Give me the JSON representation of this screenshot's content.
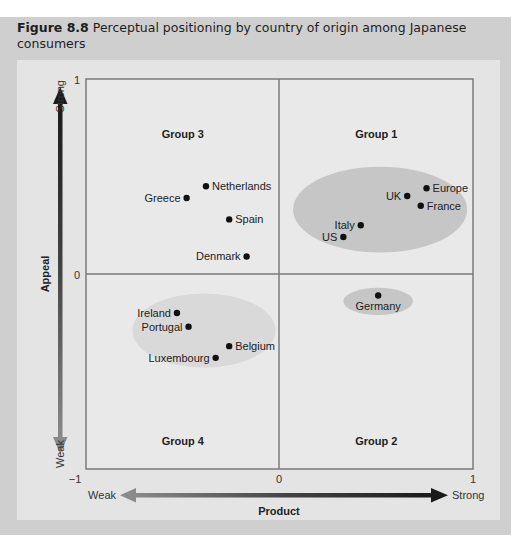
{
  "figure": {
    "number": "Figure 8.8",
    "caption": "Perceptual positioning by country of origin among Japanese consumers"
  },
  "colors": {
    "outer_panel": "#cfcfcf",
    "inner_panel": "#e4e4e4",
    "plot_bg": "#e9e9e9",
    "cluster_fill": "#c6c6c6",
    "grid_line": "#7a7a7a",
    "dot": "#111111",
    "arrow_dark": "#1a1a1a",
    "arrow_light": "#8a8a8a"
  },
  "chart_data": {
    "type": "scatter",
    "title": "Perceptual positioning by country of origin among Japanese consumers",
    "xlabel": "Product",
    "ylabel": "Appeal",
    "xlim": [
      -1,
      1
    ],
    "ylim": [
      -1,
      1
    ],
    "x_ticks": [
      "-1",
      "0",
      "1"
    ],
    "y_ticks": [
      "1",
      "0"
    ],
    "x_axis_ends": {
      "low": "Weak",
      "high": "Strong"
    },
    "y_axis_ends": {
      "low": "Weak",
      "high": "Strong"
    },
    "grid": false,
    "quadrant_lines": {
      "x": 0,
      "y": 0
    },
    "quadrants": [
      {
        "label": "Group 1",
        "position": "top-right"
      },
      {
        "label": "Group 2",
        "position": "bottom-right"
      },
      {
        "label": "Group 3",
        "position": "top-left"
      },
      {
        "label": "Group 4",
        "position": "bottom-left"
      }
    ],
    "points": [
      {
        "name": "Netherlands",
        "x": -0.38,
        "y": 0.45,
        "label_side": "right",
        "quadrant": "Group 3"
      },
      {
        "name": "Greece",
        "x": -0.48,
        "y": 0.39,
        "label_side": "left",
        "quadrant": "Group 3"
      },
      {
        "name": "Spain",
        "x": -0.26,
        "y": 0.28,
        "label_side": "right",
        "quadrant": "Group 3"
      },
      {
        "name": "Denmark",
        "x": -0.17,
        "y": 0.09,
        "label_side": "left",
        "quadrant": "Group 3"
      },
      {
        "name": "UK",
        "x": 0.66,
        "y": 0.4,
        "label_side": "left",
        "quadrant": "Group 1"
      },
      {
        "name": "Europe",
        "x": 0.76,
        "y": 0.44,
        "label_side": "right",
        "quadrant": "Group 1"
      },
      {
        "name": "France",
        "x": 0.73,
        "y": 0.35,
        "label_side": "right",
        "quadrant": "Group 1"
      },
      {
        "name": "Italy",
        "x": 0.42,
        "y": 0.25,
        "label_side": "left",
        "quadrant": "Group 1"
      },
      {
        "name": "US",
        "x": 0.33,
        "y": 0.19,
        "label_side": "left",
        "quadrant": "Group 1"
      },
      {
        "name": "Germany",
        "x": 0.51,
        "y": -0.11,
        "label_side": "below",
        "quadrant": "Group 2"
      },
      {
        "name": "Ireland",
        "x": -0.53,
        "y": -0.2,
        "label_side": "left",
        "quadrant": "Group 4"
      },
      {
        "name": "Portugal",
        "x": -0.47,
        "y": -0.27,
        "label_side": "left",
        "quadrant": "Group 4"
      },
      {
        "name": "Belgium",
        "x": -0.26,
        "y": -0.37,
        "label_side": "right",
        "quadrant": "Group 4"
      },
      {
        "name": "Luxembourg",
        "x": -0.33,
        "y": -0.43,
        "label_side": "left",
        "quadrant": "Group 4"
      }
    ],
    "clusters": [
      {
        "name": "Group 1 cluster",
        "cx": 0.52,
        "cy": 0.33,
        "rx": 0.45,
        "ry": 0.22,
        "shade": "dark"
      },
      {
        "name": "Group 2 cluster",
        "cx": 0.51,
        "cy": -0.14,
        "rx": 0.18,
        "ry": 0.07,
        "shade": "dark"
      },
      {
        "name": "Group 4 cluster",
        "cx": -0.39,
        "cy": -0.29,
        "rx": 0.37,
        "ry": 0.19,
        "shade": "light"
      }
    ]
  }
}
